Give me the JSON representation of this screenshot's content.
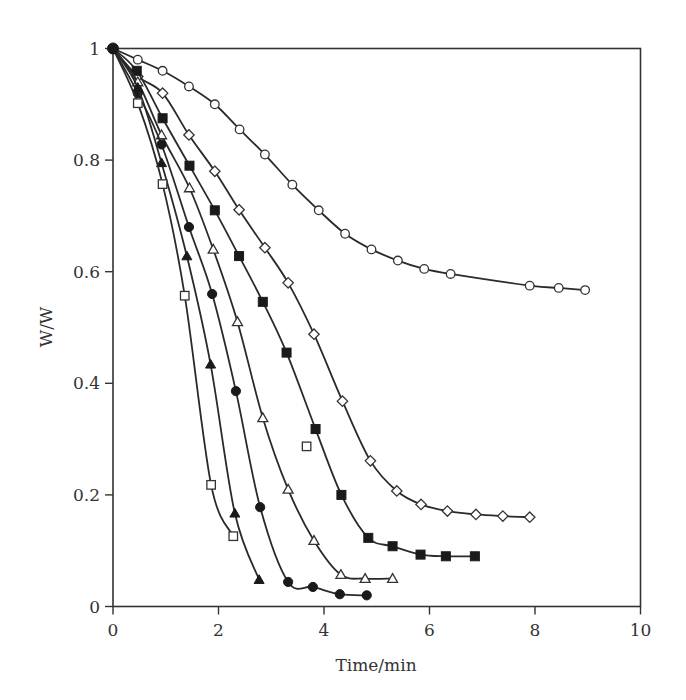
{
  "chart_data": {
    "type": "line",
    "title": "",
    "xlabel": "Time/min",
    "ylabel": "W/W",
    "xlim": [
      0,
      10
    ],
    "ylim": [
      0,
      1
    ],
    "x_ticks": [
      "0",
      "2",
      "4",
      "6",
      "8",
      "10"
    ],
    "y_ticks": [
      "0",
      "0.2",
      "0.4",
      "0.6",
      "0.8",
      "1"
    ],
    "grid": false,
    "legend": null,
    "series": [
      {
        "name": "open-circle",
        "marker": "circle",
        "filled": false,
        "x": [
          0,
          0.47,
          0.94,
          1.44,
          1.93,
          2.4,
          2.88,
          3.4,
          3.9,
          4.4,
          4.9,
          5.4,
          5.9,
          6.4,
          7.9,
          8.45,
          8.95
        ],
        "y": [
          1,
          0.98,
          0.96,
          0.932,
          0.9,
          0.855,
          0.81,
          0.756,
          0.71,
          0.668,
          0.64,
          0.62,
          0.605,
          0.596,
          0.575,
          0.571,
          0.567
        ]
      },
      {
        "name": "open-diamond",
        "marker": "diamond",
        "filled": false,
        "x": [
          0,
          0.47,
          0.94,
          1.44,
          1.93,
          2.39,
          2.88,
          3.32,
          3.81,
          4.35,
          4.88,
          5.38,
          5.84,
          6.34,
          6.88,
          7.39,
          7.9
        ],
        "y": [
          1,
          0.95,
          0.92,
          0.845,
          0.78,
          0.711,
          0.643,
          0.58,
          0.488,
          0.368,
          0.261,
          0.207,
          0.183,
          0.171,
          0.165,
          0.162,
          0.16
        ]
      },
      {
        "name": "filled-square",
        "marker": "square",
        "filled": true,
        "x": [
          0,
          0.45,
          0.94,
          1.45,
          1.93,
          2.39,
          2.84,
          3.29,
          3.84,
          4.33,
          4.84,
          5.3,
          5.83,
          6.31,
          6.86
        ],
        "y": [
          1,
          0.96,
          0.875,
          0.79,
          0.71,
          0.628,
          0.546,
          0.455,
          0.318,
          0.2,
          0.123,
          0.108,
          0.093,
          0.09,
          0.09
        ]
      },
      {
        "name": "open-triangle",
        "marker": "triangle",
        "filled": false,
        "x": [
          0,
          0.47,
          0.92,
          1.45,
          1.9,
          2.36,
          2.84,
          3.32,
          3.81,
          4.32,
          4.78,
          5.3
        ],
        "y": [
          1,
          0.94,
          0.845,
          0.75,
          0.64,
          0.51,
          0.338,
          0.21,
          0.118,
          0.057,
          0.05,
          0.05
        ]
      },
      {
        "name": "filled-circle",
        "marker": "circle",
        "filled": true,
        "x": [
          0,
          0.47,
          0.92,
          1.44,
          1.88,
          2.33,
          2.79,
          3.32,
          3.79,
          4.3,
          4.81
        ],
        "y": [
          1,
          0.92,
          0.828,
          0.68,
          0.56,
          0.386,
          0.178,
          0.044,
          0.035,
          0.022,
          0.02
        ]
      },
      {
        "name": "filled-triangle",
        "marker": "triangle",
        "filled": true,
        "x": [
          0,
          0.47,
          0.92,
          1.4,
          1.85,
          2.31,
          2.77
        ],
        "y": [
          1,
          0.93,
          0.795,
          0.628,
          0.434,
          0.167,
          0.048
        ]
      },
      {
        "name": "open-square",
        "marker": "square",
        "filled": false,
        "x": [
          0,
          0.47,
          0.94,
          1.36,
          1.86,
          2.28
        ],
        "y": [
          1,
          0.902,
          0.757,
          0.557,
          0.218,
          0.126
        ]
      }
    ],
    "annotations": [
      {
        "name": "isolated-open-square",
        "marker": "square",
        "filled": false,
        "x": 3.67,
        "y": 0.287
      }
    ]
  }
}
